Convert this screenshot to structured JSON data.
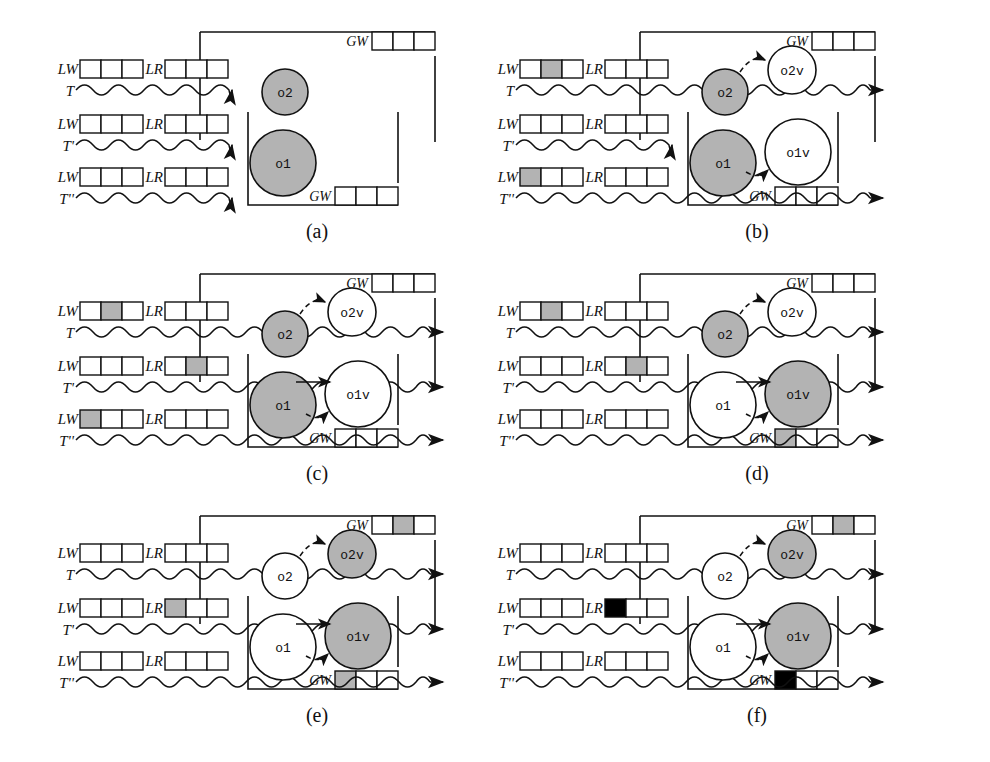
{
  "figure": {
    "colors": {
      "shaded": "#b3b3b3",
      "black": "#000000",
      "white": "#ffffff",
      "stroke": "#111111"
    },
    "labels": {
      "local_write": "LW",
      "local_read": "LR",
      "global_write": "GW",
      "txn1": "T",
      "txn2": "T'",
      "txn3": "T''",
      "obj1": "o1",
      "obj2": "o2",
      "obj1v": "o1v",
      "obj2v": "o2v"
    },
    "cells_per_log": 3
  },
  "panels": [
    {
      "id": "a",
      "caption": "(a)",
      "rows": [
        {
          "txn": "T",
          "lw": [
            0,
            0,
            0
          ],
          "lr": [
            0,
            0,
            0
          ],
          "wave_enters_box": false
        },
        {
          "txn": "T'",
          "lw": [
            0,
            0,
            0
          ],
          "lr": [
            0,
            0,
            0
          ],
          "wave_enters_box": false
        },
        {
          "txn": "T''",
          "lw": [
            0,
            0,
            0
          ],
          "lr": [
            0,
            0,
            0
          ],
          "wave_enters_box": false
        }
      ],
      "gw_top": [
        0,
        0,
        0
      ],
      "gw_bottom": [
        0,
        0,
        0
      ],
      "objects": [
        {
          "name": "o2",
          "shaded": true,
          "visible": true
        },
        {
          "name": "o1",
          "shaded": true,
          "visible": true
        },
        {
          "name": "o2v",
          "shaded": false,
          "visible": false
        },
        {
          "name": "o1v",
          "shaded": false,
          "visible": false
        }
      ]
    },
    {
      "id": "b",
      "caption": "(b)",
      "rows": [
        {
          "txn": "T",
          "lw": [
            0,
            1,
            0
          ],
          "lr": [
            0,
            0,
            0
          ],
          "wave_enters_box": true
        },
        {
          "txn": "T'",
          "lw": [
            0,
            0,
            0
          ],
          "lr": [
            0,
            0,
            0
          ],
          "wave_enters_box": false
        },
        {
          "txn": "T''",
          "lw": [
            1,
            0,
            0
          ],
          "lr": [
            0,
            0,
            0
          ],
          "wave_enters_box": true
        }
      ],
      "gw_top": [
        0,
        0,
        0
      ],
      "gw_bottom": [
        0,
        0,
        0
      ],
      "objects": [
        {
          "name": "o2",
          "shaded": true,
          "visible": true
        },
        {
          "name": "o1",
          "shaded": true,
          "visible": true
        },
        {
          "name": "o2v",
          "shaded": false,
          "visible": true
        },
        {
          "name": "o1v",
          "shaded": false,
          "visible": true
        }
      ]
    },
    {
      "id": "c",
      "caption": "(c)",
      "rows": [
        {
          "txn": "T",
          "lw": [
            0,
            1,
            0
          ],
          "lr": [
            0,
            0,
            0
          ],
          "wave_enters_box": true
        },
        {
          "txn": "T'",
          "lw": [
            0,
            0,
            0
          ],
          "lr": [
            0,
            1,
            0
          ],
          "wave_enters_box": true
        },
        {
          "txn": "T''",
          "lw": [
            1,
            0,
            0
          ],
          "lr": [
            0,
            0,
            0
          ],
          "wave_enters_box": true
        }
      ],
      "gw_top": [
        0,
        0,
        0
      ],
      "gw_bottom": [
        0,
        0,
        0
      ],
      "objects": [
        {
          "name": "o2",
          "shaded": true,
          "visible": true
        },
        {
          "name": "o1",
          "shaded": true,
          "visible": true
        },
        {
          "name": "o2v",
          "shaded": false,
          "visible": true
        },
        {
          "name": "o1v",
          "shaded": false,
          "visible": true
        }
      ]
    },
    {
      "id": "d",
      "caption": "(d)",
      "rows": [
        {
          "txn": "T",
          "lw": [
            0,
            1,
            0
          ],
          "lr": [
            0,
            0,
            0
          ],
          "wave_enters_box": true
        },
        {
          "txn": "T'",
          "lw": [
            0,
            0,
            0
          ],
          "lr": [
            0,
            1,
            0
          ],
          "wave_enters_box": true
        },
        {
          "txn": "T''",
          "lw": [
            0,
            0,
            0
          ],
          "lr": [
            0,
            0,
            0
          ],
          "wave_enters_box": true
        }
      ],
      "gw_top": [
        0,
        0,
        0
      ],
      "gw_bottom": [
        1,
        0,
        0
      ],
      "objects": [
        {
          "name": "o2",
          "shaded": true,
          "visible": true
        },
        {
          "name": "o1",
          "shaded": false,
          "visible": true
        },
        {
          "name": "o2v",
          "shaded": false,
          "visible": true
        },
        {
          "name": "o1v",
          "shaded": true,
          "visible": true
        }
      ]
    },
    {
      "id": "e",
      "caption": "(e)",
      "rows": [
        {
          "txn": "T",
          "lw": [
            0,
            0,
            0
          ],
          "lr": [
            0,
            0,
            0
          ],
          "wave_enters_box": true
        },
        {
          "txn": "T'",
          "lw": [
            0,
            0,
            0
          ],
          "lr": [
            1,
            0,
            0
          ],
          "wave_enters_box": true
        },
        {
          "txn": "T''",
          "lw": [
            0,
            0,
            0
          ],
          "lr": [
            0,
            0,
            0
          ],
          "wave_enters_box": true
        }
      ],
      "gw_top": [
        0,
        1,
        0
      ],
      "gw_bottom": [
        1,
        0,
        0
      ],
      "objects": [
        {
          "name": "o2",
          "shaded": false,
          "visible": true
        },
        {
          "name": "o1",
          "shaded": false,
          "visible": true
        },
        {
          "name": "o2v",
          "shaded": true,
          "visible": true
        },
        {
          "name": "o1v",
          "shaded": true,
          "visible": true
        }
      ]
    },
    {
      "id": "f",
      "caption": "(f)",
      "rows": [
        {
          "txn": "T",
          "lw": [
            0,
            0,
            0
          ],
          "lr": [
            0,
            0,
            0
          ],
          "wave_enters_box": true
        },
        {
          "txn": "T'",
          "lw": [
            0,
            0,
            0
          ],
          "lr": [
            2,
            0,
            0
          ],
          "wave_enters_box": true
        },
        {
          "txn": "T''",
          "lw": [
            0,
            0,
            0
          ],
          "lr": [
            0,
            0,
            0
          ],
          "wave_enters_box": true
        }
      ],
      "gw_top": [
        0,
        1,
        0
      ],
      "gw_bottom": [
        2,
        0,
        0
      ],
      "objects": [
        {
          "name": "o2",
          "shaded": false,
          "visible": true
        },
        {
          "name": "o1",
          "shaded": false,
          "visible": true
        },
        {
          "name": "o2v",
          "shaded": true,
          "visible": true
        },
        {
          "name": "o1v",
          "shaded": true,
          "visible": true
        }
      ]
    }
  ]
}
